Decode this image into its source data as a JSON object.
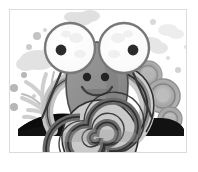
{
  "artwork": {
    "title": "Cartoon Snail Illustration",
    "subject": "snail",
    "style": "grayscale flat vector clip-art",
    "framed": true,
    "frame": {
      "border_color": "#dcdcdc",
      "background_color": "#ffffff",
      "inset_left": 9,
      "inset_top": 9,
      "width": 178,
      "height": 144
    },
    "canvas": {
      "width": 198,
      "height": 172,
      "background_color": "#ffffff"
    }
  },
  "palette": {
    "page_background": "#ffffff",
    "frame_border": "#dcdcdc",
    "body_fill": "#8f8f8f",
    "body_shadow": "#6f6f6f",
    "body_outline": "#4a4a4a",
    "eye_white": "#fdfdfd",
    "eye_rim": "#7a7a7a",
    "pupil": "#2b2b2b",
    "shell_light": "#d6d6d6",
    "shell_mid": "#a8a8a8",
    "shell_dark": "#5c5c5c",
    "shell_outline": "#333333",
    "ground_dark": "#141414",
    "background_cloud": "#e3e3e3",
    "background_cloud_soft": "#eeeeee",
    "ring_outer": "#b9b9b9",
    "ring_mid": "#9d9d9d",
    "ring_inner": "#c9c9c9",
    "dot_gray": "#b4b4b4",
    "grass_gray": "#d2d2d2",
    "antenna": "#3a3a3a"
  },
  "elements": {
    "left_eye": {
      "label": "Left eye",
      "cx": 70,
      "cy": 48,
      "r": 25,
      "pupil_cx": 61,
      "pupil_cy": 50,
      "pupil_r": 5
    },
    "right_eye": {
      "label": "Right eye",
      "cx": 124,
      "cy": 48,
      "r": 25,
      "pupil_cx": 133,
      "pupil_cy": 50,
      "pupil_r": 5
    },
    "nostril_left": {
      "label": "Left nostril",
      "cx": 87,
      "cy": 77,
      "r": 4
    },
    "nostril_right": {
      "label": "Right nostril",
      "cx": 105,
      "cy": 77,
      "r": 4
    },
    "mouth": {
      "label": "Smiling mouth"
    },
    "body": {
      "label": "Snail body"
    },
    "shell_spiral": {
      "label": "Spiral shell",
      "cx": 100,
      "cy": 137,
      "turns": 4
    },
    "shell_arc": {
      "label": "Striped shell arc"
    },
    "ground": {
      "label": "Dark ground silhouette"
    },
    "cloud_top": {
      "label": "Top cloud",
      "cx": 84,
      "cy": 17
    },
    "cloud_right": {
      "label": "Right background cloud",
      "cx": 152,
      "cy": 46
    },
    "cloud_left": {
      "label": "Left background cloud",
      "cx": 36,
      "cy": 60
    },
    "rings": [
      {
        "label": "Background ring 1",
        "cx": 148,
        "cy": 75,
        "r": 14
      },
      {
        "label": "Background ring 2",
        "cx": 163,
        "cy": 95,
        "r": 17
      },
      {
        "label": "Background ring 3",
        "cx": 170,
        "cy": 118,
        "r": 12
      }
    ],
    "dots": [
      {
        "cx": 14,
        "cy": 88,
        "r": 4
      },
      {
        "cx": 14,
        "cy": 107,
        "r": 4
      },
      {
        "cx": 24,
        "cy": 75,
        "r": 3
      },
      {
        "cx": 29,
        "cy": 47,
        "r": 3
      },
      {
        "cx": 37,
        "cy": 36,
        "r": 4
      },
      {
        "cx": 45,
        "cy": 30,
        "r": 2
      },
      {
        "cx": 153,
        "cy": 22,
        "r": 3
      },
      {
        "cx": 168,
        "cy": 58,
        "r": 2
      },
      {
        "cx": 178,
        "cy": 70,
        "r": 3
      }
    ],
    "grass_blades": {
      "label": "Grass blades",
      "count": 5
    }
  }
}
